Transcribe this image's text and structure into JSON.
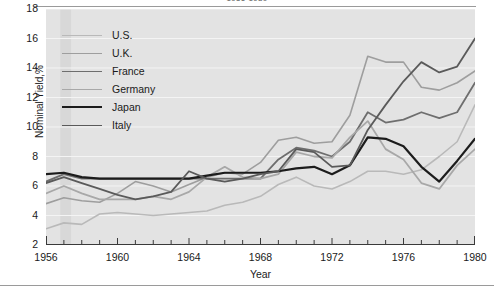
{
  "figure": {
    "title": "1956-1980",
    "xlabel": "Year",
    "ylabel": "Nominal Yield,%"
  },
  "axes": {
    "yticks": [
      "18",
      "16",
      "14",
      "12",
      "10",
      "8",
      "6",
      "4",
      "2"
    ],
    "xticks": [
      "1956",
      "1960",
      "1964",
      "1968",
      "1972",
      "1976",
      "1980"
    ]
  },
  "legend": {
    "items": [
      {
        "label": "U.S.",
        "color": "#b9b9b9",
        "width": 1.6
      },
      {
        "label": "U.K.",
        "color": "#9e9e9e",
        "width": 1.6
      },
      {
        "label": "France",
        "color": "#6e6e6e",
        "width": 1.8
      },
      {
        "label": "Germany",
        "color": "#a8a8a8",
        "width": 1.8
      },
      {
        "label": "Japan",
        "color": "#1c1c1c",
        "width": 2.2
      },
      {
        "label": "Italy",
        "color": "#5a5a5a",
        "width": 1.8
      }
    ]
  },
  "chart_data": {
    "type": "line",
    "title": "1956-1980",
    "xlabel": "Year",
    "ylabel": "Nominal Yield,%",
    "xlim": [
      1956,
      1980
    ],
    "ylim": [
      2,
      18
    ],
    "grid": "horizontal-white",
    "legend_position": "upper-left-inside",
    "x": [
      1956,
      1957,
      1958,
      1959,
      1960,
      1961,
      1962,
      1963,
      1964,
      1965,
      1966,
      1967,
      1968,
      1969,
      1970,
      1971,
      1972,
      1973,
      1974,
      1975,
      1976,
      1977,
      1978,
      1979,
      1980
    ],
    "series": [
      {
        "name": "U.S.",
        "color": "#b9b9b9",
        "values": [
          3.1,
          3.5,
          3.4,
          4.1,
          4.2,
          4.1,
          4.0,
          4.1,
          4.2,
          4.3,
          4.7,
          4.9,
          5.3,
          6.1,
          6.6,
          6.0,
          5.8,
          6.3,
          7.0,
          7.0,
          6.8,
          7.1,
          8.0,
          9.0,
          11.5
        ]
      },
      {
        "name": "U.K.",
        "color": "#9e9e9e",
        "values": [
          4.8,
          5.2,
          5.0,
          4.9,
          5.5,
          6.3,
          6.0,
          5.6,
          6.1,
          6.6,
          6.9,
          6.8,
          7.6,
          9.1,
          9.3,
          8.9,
          9.0,
          10.8,
          14.8,
          14.4,
          14.4,
          12.7,
          12.5,
          13.0,
          13.8
        ]
      },
      {
        "name": "France",
        "color": "#6e6e6e",
        "values": [
          6.3,
          6.8,
          6.5,
          6.5,
          6.5,
          6.5,
          6.5,
          6.5,
          6.5,
          6.5,
          6.5,
          6.5,
          6.5,
          7.8,
          8.6,
          8.4,
          8.0,
          9.0,
          11.0,
          10.3,
          10.5,
          11.0,
          10.6,
          11.0,
          13.0
        ]
      },
      {
        "name": "Germany",
        "color": "#a8a8a8",
        "values": [
          5.5,
          6.0,
          5.5,
          5.1,
          5.1,
          5.1,
          5.3,
          5.1,
          5.6,
          6.6,
          7.3,
          6.6,
          6.5,
          6.8,
          8.3,
          8.0,
          7.9,
          9.3,
          10.4,
          8.5,
          7.8,
          6.2,
          5.8,
          7.4,
          8.5
        ]
      },
      {
        "name": "Japan",
        "color": "#1c1c1c",
        "values": [
          6.8,
          6.9,
          6.6,
          6.5,
          6.5,
          6.5,
          6.5,
          6.5,
          6.5,
          6.7,
          6.9,
          6.9,
          6.9,
          7.0,
          7.2,
          7.3,
          6.8,
          7.4,
          9.3,
          9.2,
          8.7,
          7.3,
          6.3,
          7.7,
          9.2
        ]
      },
      {
        "name": "Italy",
        "color": "#5a5a5a",
        "values": [
          6.2,
          6.6,
          6.2,
          5.8,
          5.4,
          5.1,
          5.3,
          5.6,
          7.0,
          6.5,
          6.3,
          6.5,
          6.8,
          7.0,
          8.5,
          8.3,
          7.3,
          7.4,
          9.8,
          11.5,
          13.1,
          14.4,
          13.7,
          14.1,
          16.0
        ]
      }
    ]
  }
}
